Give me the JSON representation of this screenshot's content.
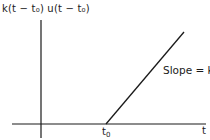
{
  "figure": {
    "y_axis_label": "k(t − t₀) u(t − t₀)",
    "x_axis_label": "t",
    "t0_label_base": "t",
    "t0_label_sub": "0",
    "annotation": "Slope = k"
  },
  "colors": {
    "line": "#1a1a1a",
    "background": "#ffffff"
  },
  "geometry": {
    "origin": [
      41,
      124
    ],
    "ramp_start": [
      106,
      124
    ],
    "ramp_end": [
      184,
      32
    ],
    "x_axis": [
      12,
      206
    ],
    "y_axis": [
      20,
      138
    ]
  }
}
